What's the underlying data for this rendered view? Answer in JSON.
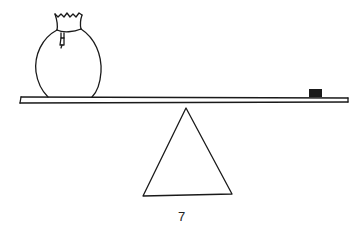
{
  "illustration": {
    "subject": "balance-seesaw",
    "left_object": "money-bag",
    "right_object": "small-weight",
    "fulcrum": "triangle",
    "stroke_color": "#1a1a1a",
    "background": "#ffffff"
  },
  "page": {
    "number": "7"
  }
}
